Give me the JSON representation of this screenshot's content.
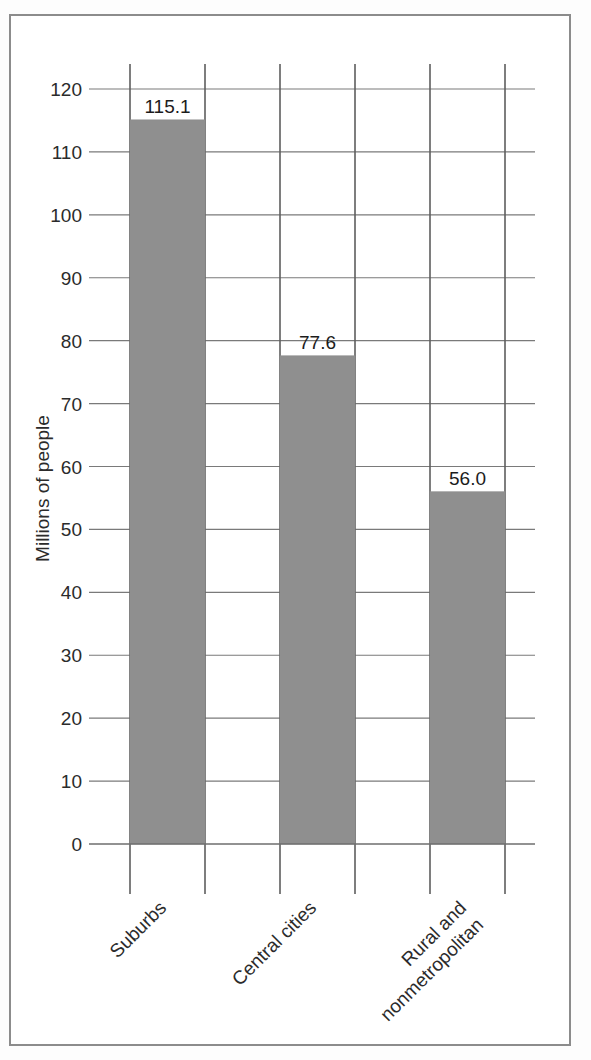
{
  "page": {
    "scan_artifact_text": "",
    "background_color": "#ffffff",
    "frame_border_color": "#8c8c8c"
  },
  "chart_data": {
    "type": "bar",
    "title": "",
    "subtitle": "",
    "xlabel": "",
    "ylabel": "Millions of people",
    "categories": [
      "Suburbs",
      "Central cities",
      "Rural and nonmetropolitan"
    ],
    "category_lines": [
      [
        "Suburbs"
      ],
      [
        "Central cities"
      ],
      [
        "Rural and",
        "nonmetropolitan"
      ]
    ],
    "values": [
      115.1,
      77.6,
      56.0
    ],
    "value_labels": [
      "115.1",
      "77.6",
      "56.0"
    ],
    "ylim": [
      0,
      120
    ],
    "ytick_step": 10,
    "yticks": [
      0,
      10,
      20,
      30,
      40,
      50,
      60,
      70,
      80,
      90,
      100,
      110,
      120
    ],
    "ytick_labels": [
      "0",
      "10",
      "20",
      "30",
      "40",
      "50",
      "60",
      "70",
      "80",
      "90",
      "100",
      "110",
      "120"
    ],
    "grid": true,
    "grid_orientation": "both",
    "legend": false,
    "legend_position": "none",
    "bar_color": "#8f8f8f",
    "gridline_color": "#5e5e5e",
    "axis_color": "#6e6e6e",
    "category_label_rotation_deg": -45,
    "ylabel_rotation_deg": -90
  }
}
